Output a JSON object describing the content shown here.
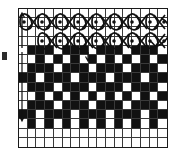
{
  "figure": {
    "name": "knitting-stitch-chart",
    "grid": {
      "columns": 17,
      "rows": 15,
      "line_color": "#3a3a3a",
      "border_color": "#1a1a1a",
      "background": "#ffffff"
    },
    "fill_color": "#111111",
    "symbols": {
      "circled_dot": "⊙",
      "cross": "×"
    },
    "yarn_rows": [
      {
        "row_index": 1,
        "name": "upper-yarn-pass",
        "loop_count": 8,
        "cross_count": 8,
        "start_column": 1,
        "end_column": 16,
        "wraps_right": true
      },
      {
        "row_index": 2,
        "name": "lower-yarn-pass",
        "loop_count": 8,
        "cross_count": 7,
        "start_column": 3,
        "end_column": 16,
        "wraps_right": false
      }
    ],
    "pattern_rows": [
      {
        "row": 1,
        "filled": []
      },
      {
        "row": 2,
        "filled": []
      },
      {
        "row": 3,
        "filled": []
      },
      {
        "row": 4,
        "filled": []
      },
      {
        "row": 5,
        "filled": [
          1,
          2,
          3,
          5,
          6,
          7,
          9,
          10,
          11,
          13,
          14,
          15
        ]
      },
      {
        "row": 6,
        "filled": [
          2,
          4,
          6,
          8,
          10,
          12,
          14,
          16
        ]
      },
      {
        "row": 7,
        "filled": [
          1,
          2,
          3,
          5,
          6,
          7,
          9,
          10,
          11,
          13,
          14,
          15
        ]
      },
      {
        "row": 8,
        "filled": [
          0,
          1,
          3,
          4,
          5,
          7,
          8,
          9,
          11,
          12,
          13,
          15,
          16
        ]
      },
      {
        "row": 9,
        "filled": [
          1,
          2,
          3,
          5,
          6,
          7,
          9,
          10,
          11,
          13,
          14,
          15
        ]
      },
      {
        "row": 10,
        "filled": [
          2,
          4,
          6,
          8,
          10,
          12,
          14,
          16
        ]
      },
      {
        "row": 11,
        "filled": [
          1,
          2,
          3,
          5,
          6,
          7,
          9,
          10,
          11,
          13,
          14,
          15
        ]
      },
      {
        "row": 12,
        "filled": [
          0,
          1,
          3,
          4,
          5,
          7,
          8,
          9,
          11,
          12,
          13,
          15,
          16
        ]
      },
      {
        "row": 13,
        "filled": [
          1,
          3,
          5,
          7,
          9,
          11,
          13,
          15
        ]
      },
      {
        "row": 14,
        "filled": []
      },
      {
        "row": 15,
        "filled": []
      }
    ],
    "annotations": {
      "start_arrow": "yarn-entry-direction",
      "end_arrow": "yarn-exit-direction",
      "mid_arrow": "pattern-repeat-marker",
      "margin_tick": "row-reference-tick"
    }
  }
}
